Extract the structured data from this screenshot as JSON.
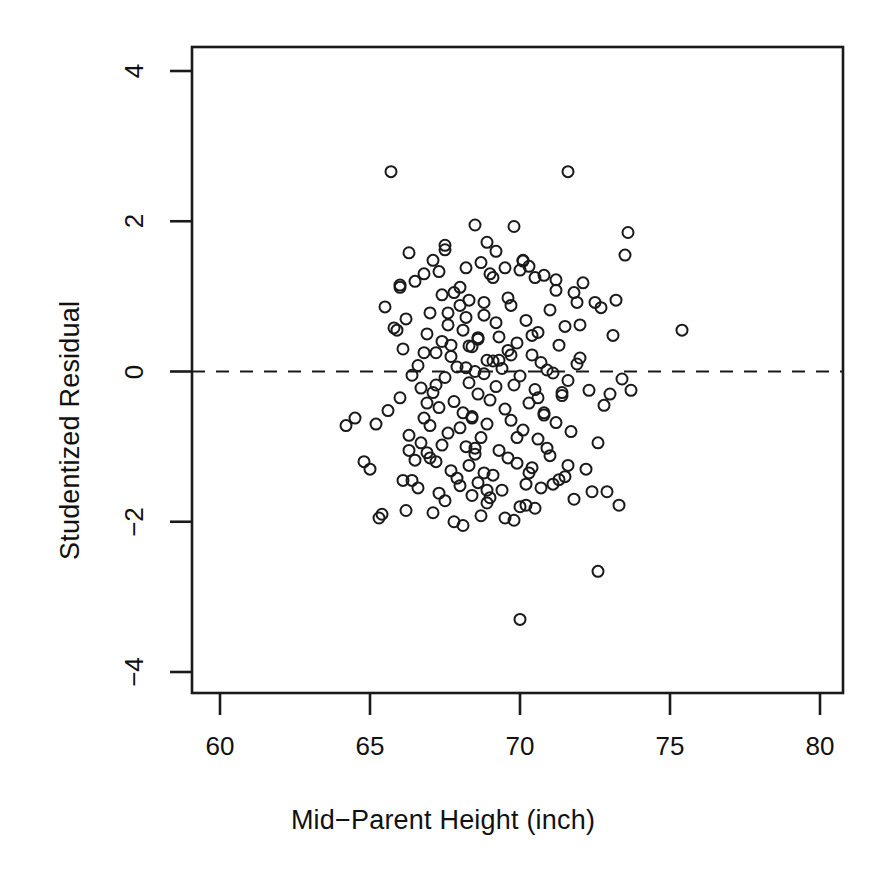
{
  "chart_data": {
    "type": "scatter",
    "title": "",
    "subtitle": "",
    "xlabel": "Mid−Parent Height (inch)",
    "ylabel": "Studentized Residual",
    "xlim": [
      58.7,
      82.1
    ],
    "ylim": [
      -4.65,
      4.55
    ],
    "xticks": [
      60,
      65,
      70,
      75,
      80
    ],
    "xtick_labels": [
      "60",
      "65",
      "70",
      "75",
      "80"
    ],
    "yticks": [
      -4,
      -2,
      0,
      2,
      4
    ],
    "ytick_labels": [
      "-4",
      "-2",
      "0",
      "2",
      "4"
    ],
    "grid": false,
    "legend": null,
    "marker": {
      "shape": "open-circle",
      "radius_px": 5.5,
      "stroke": "#1a1a1a",
      "stroke_width": 2.0,
      "fill": "none"
    },
    "reference_lines": [
      {
        "name": "zero-residual-line",
        "orientation": "horizontal",
        "y": 0,
        "style": "dashed",
        "color": "#1a1a1a",
        "width": 2.2
      }
    ],
    "frame": {
      "box": true,
      "color": "#1a1a1a",
      "width": 2.5
    },
    "n_points": 205,
    "x": [
      65.7,
      71.6,
      68.5,
      67.5,
      69.8,
      66.3,
      68.2,
      70.5,
      73.6,
      66.8,
      67.1,
      68.9,
      70.1,
      71.2,
      66.0,
      67.8,
      69.2,
      70.8,
      72.1,
      65.9,
      67.3,
      68.7,
      69.5,
      70.3,
      71.8,
      66.5,
      68.0,
      69.0,
      70.0,
      72.5,
      65.5,
      67.0,
      68.3,
      69.7,
      71.0,
      66.2,
      67.6,
      68.8,
      70.2,
      71.5,
      64.2,
      66.9,
      68.1,
      69.3,
      70.6,
      73.1,
      67.4,
      68.6,
      69.9,
      71.3,
      66.1,
      67.2,
      68.4,
      69.6,
      70.4,
      72.0,
      65.8,
      67.7,
      68.9,
      70.7,
      71.9,
      66.6,
      68.2,
      69.1,
      70.9,
      73.4,
      67.9,
      68.5,
      69.4,
      71.1,
      66.4,
      67.5,
      68.8,
      70.0,
      71.6,
      64.5,
      66.7,
      68.3,
      69.8,
      72.3,
      67.1,
      68.6,
      69.2,
      70.5,
      71.4,
      66.0,
      67.8,
      69.0,
      70.3,
      72.8,
      65.6,
      67.3,
      68.1,
      69.5,
      70.8,
      73.0,
      66.8,
      68.4,
      69.7,
      71.2,
      67.0,
      68.0,
      68.9,
      70.1,
      71.7,
      66.3,
      67.6,
      68.7,
      70.6,
      72.6,
      65.2,
      67.4,
      68.2,
      69.3,
      70.9,
      73.7,
      66.9,
      68.5,
      69.6,
      71.0,
      66.5,
      67.2,
      68.3,
      69.9,
      70.4,
      72.2,
      67.7,
      68.8,
      69.1,
      71.5,
      66.1,
      67.9,
      68.6,
      70.2,
      71.3,
      64.8,
      66.6,
      68.0,
      69.4,
      72.9,
      67.3,
      68.4,
      69.0,
      70.7,
      71.8,
      65.4,
      67.5,
      68.9,
      70.0,
      73.3,
      66.2,
      67.1,
      68.7,
      69.5,
      70.5,
      72.4,
      67.8,
      68.1,
      69.8,
      71.1,
      66.7,
      67.0,
      68.5,
      70.3,
      71.6,
      65.0,
      66.4,
      68.2,
      69.2,
      72.7,
      67.6,
      68.8,
      69.6,
      70.8,
      71.2,
      66.0,
      67.4,
      68.0,
      70.1,
      73.5,
      70.0,
      72.6,
      75.4,
      66.9,
      68.3,
      69.7,
      71.4,
      66.8,
      67.2,
      68.6,
      69.3,
      70.6,
      72.0,
      65.3,
      67.7,
      68.4,
      69.9,
      71.9,
      66.3,
      68.9,
      70.2,
      73.2,
      67.5,
      69.1,
      70.4
    ],
    "y": [
      2.66,
      2.66,
      1.95,
      1.62,
      1.93,
      1.58,
      1.38,
      1.25,
      1.85,
      1.3,
      1.48,
      1.72,
      1.47,
      1.22,
      1.15,
      1.05,
      1.6,
      1.28,
      1.18,
      0.55,
      1.33,
      1.45,
      1.38,
      1.4,
      1.05,
      1.2,
      1.12,
      1.3,
      1.35,
      0.92,
      0.86,
      0.78,
      0.95,
      0.88,
      0.82,
      0.7,
      0.62,
      0.75,
      0.68,
      0.6,
      -0.72,
      0.5,
      0.55,
      0.46,
      0.52,
      0.48,
      0.4,
      0.43,
      0.38,
      0.35,
      0.3,
      0.25,
      0.33,
      0.28,
      0.22,
      0.18,
      0.58,
      0.2,
      0.15,
      0.12,
      0.1,
      0.08,
      0.05,
      0.14,
      0.02,
      -0.1,
      0.06,
      0.0,
      0.04,
      -0.02,
      -0.05,
      -0.08,
      -0.03,
      -0.06,
      -0.12,
      -0.62,
      -0.22,
      -0.15,
      -0.18,
      -0.25,
      -0.28,
      -0.3,
      -0.2,
      -0.24,
      -0.32,
      -0.35,
      -0.4,
      -0.38,
      -0.42,
      -0.45,
      -0.52,
      -0.48,
      -0.55,
      -0.5,
      -0.58,
      -0.3,
      -0.62,
      -0.6,
      -0.65,
      -0.68,
      -0.72,
      -0.75,
      -0.7,
      -0.78,
      -0.8,
      -0.85,
      -0.82,
      -0.88,
      -0.9,
      -0.95,
      -0.7,
      -0.98,
      -1.0,
      -1.05,
      -1.02,
      -0.25,
      -1.08,
      -1.1,
      -1.15,
      -1.12,
      -1.18,
      -1.2,
      -1.25,
      -1.22,
      -1.28,
      -1.3,
      -1.32,
      -1.35,
      -1.38,
      -1.4,
      -1.45,
      -1.42,
      -1.48,
      -1.5,
      -1.44,
      -1.2,
      -1.55,
      -1.52,
      -1.58,
      -1.6,
      -1.62,
      -1.65,
      -1.68,
      -1.55,
      -1.7,
      -1.9,
      -1.72,
      -1.75,
      -1.8,
      -1.78,
      -1.85,
      -1.88,
      -1.92,
      -1.95,
      -1.82,
      -1.6,
      -2.0,
      -2.05,
      -1.98,
      -1.5,
      -0.95,
      -1.15,
      -1.02,
      -1.35,
      -1.25,
      -1.3,
      -1.45,
      0.72,
      0.65,
      0.85,
      0.78,
      0.92,
      0.98,
      -0.55,
      1.08,
      1.12,
      1.02,
      0.88,
      1.48,
      1.55,
      -3.3,
      -2.66,
      0.55,
      -0.42,
      0.34,
      0.22,
      -0.28,
      0.25,
      -0.18,
      0.45,
      0.15,
      -0.35,
      0.62,
      -1.95,
      0.35,
      -0.62,
      -0.88,
      0.92,
      -1.05,
      -1.58,
      -1.78,
      0.95,
      1.68,
      1.25,
      0.48
    ]
  },
  "axis": {
    "x_title": "Mid−Parent Height (inch)",
    "y_title": "Studentized Residual"
  }
}
